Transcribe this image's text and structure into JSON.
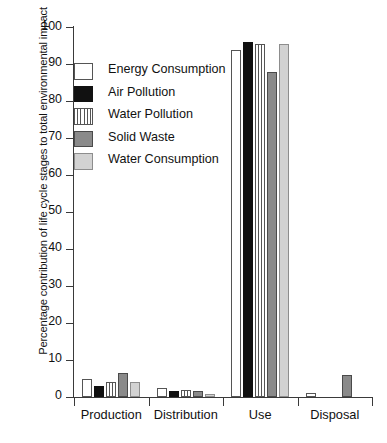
{
  "chart_data": {
    "type": "bar",
    "title": "",
    "xlabel": "",
    "ylabel": "Percentage contribution of life cycle stages to total environmental impact",
    "categories": [
      "Production",
      "Distribution",
      "Use",
      "Disposal"
    ],
    "ylim": [
      0,
      100
    ],
    "ytick_values": [
      0,
      10,
      20,
      30,
      40,
      50,
      60,
      70,
      80,
      90,
      100
    ],
    "ytick_labels": [
      "0",
      "10",
      "20",
      "30",
      "40",
      "50",
      "60",
      "70",
      "80",
      "90",
      "100"
    ],
    "grid": false,
    "legend_position": "upper-left-inside",
    "series": [
      {
        "name": "Energy Consumption",
        "fill": "white",
        "color": "#ffffff",
        "values": [
          5.0,
          2.5,
          94.0,
          1.0
        ]
      },
      {
        "name": "Air Pollution",
        "fill": "solid-black",
        "color": "#111111",
        "values": [
          3.0,
          1.5,
          96.0,
          0.0
        ]
      },
      {
        "name": "Water Pollution",
        "fill": "vertical-stripes",
        "color": "#ffffff",
        "values": [
          4.0,
          2.0,
          95.5,
          0.0
        ]
      },
      {
        "name": "Solid Waste",
        "fill": "dark-gray",
        "color": "#8a8a8a",
        "values": [
          6.5,
          1.5,
          88.0,
          6.0
        ]
      },
      {
        "name": "Water Consumption",
        "fill": "light-gray",
        "color": "#d2d2d2",
        "values": [
          4.0,
          0.8,
          95.5,
          0.0
        ]
      }
    ]
  },
  "legend": {
    "items": [
      {
        "label": "Energy Consumption"
      },
      {
        "label": "Air Pollution"
      },
      {
        "label": "Water Pollution"
      },
      {
        "label": "Solid Waste"
      },
      {
        "label": "Water Consumption"
      }
    ]
  }
}
